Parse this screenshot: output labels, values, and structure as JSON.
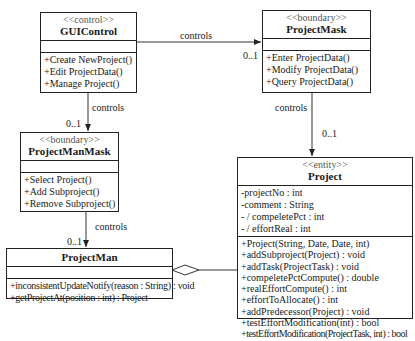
{
  "classes": {
    "gui_control": {
      "stereotype": "<<control>>",
      "name": "GUIControl",
      "attributes": [],
      "operations": [
        "+Create NewProject()",
        "+Edit ProjectData()",
        "+Manage Project()"
      ]
    },
    "project_mask": {
      "stereotype": "<<boundary>>",
      "name": "ProjectMask",
      "attributes": [],
      "operations": [
        "+Enter ProjectData()",
        "+Modify ProjectData()",
        "+Query ProjectData()"
      ]
    },
    "project_man_mask": {
      "stereotype": "<<boundary>>",
      "name": "ProjectManMask",
      "attributes": [],
      "operations": [
        "+Select Project()",
        "+Add Subproject()",
        "+Remove Subproject()"
      ]
    },
    "project": {
      "stereotype": "<<entity>>",
      "name": "Project",
      "attributes": [
        "-projectNo : int",
        "-comment : String",
        "- / compeletePct : int",
        "- / effortReal : int"
      ],
      "operations": [
        "+Project(String, Date, Date, int)",
        "+addSubproject(Project) : void",
        "+addTask(ProjectTask) : void",
        "+compeletePctCompute() : double",
        "+realEffortCompute() : int",
        "+effortToAllocate() : int",
        "+addPredecessor(Project) : void",
        "+testEffortModification(int) : bool",
        "+testEffortModification(ProjectTask, int) : bool"
      ]
    },
    "project_man": {
      "stereotype": "",
      "name": "ProjectMan",
      "attributes": [],
      "operations": [
        "+inconsistentUpdateNotify(reason : String) : void",
        "+getProjectAt(position : int) : Project"
      ]
    }
  },
  "associations": {
    "gui_to_mask": {
      "label": "controls",
      "multiplicity": "0..1"
    },
    "gui_to_manmask": {
      "label": "controls",
      "multiplicity": "0..1"
    },
    "mask_to_project": {
      "label": "controls",
      "multiplicity": "0..1"
    },
    "manmask_to_man": {
      "label": "controls",
      "multiplicity": "0..1"
    },
    "man_aggregates_project": {
      "label": "",
      "type": "aggregation"
    }
  },
  "colors": {
    "line": "#222222",
    "stereotype": "#555555",
    "background": "#ffffff"
  }
}
